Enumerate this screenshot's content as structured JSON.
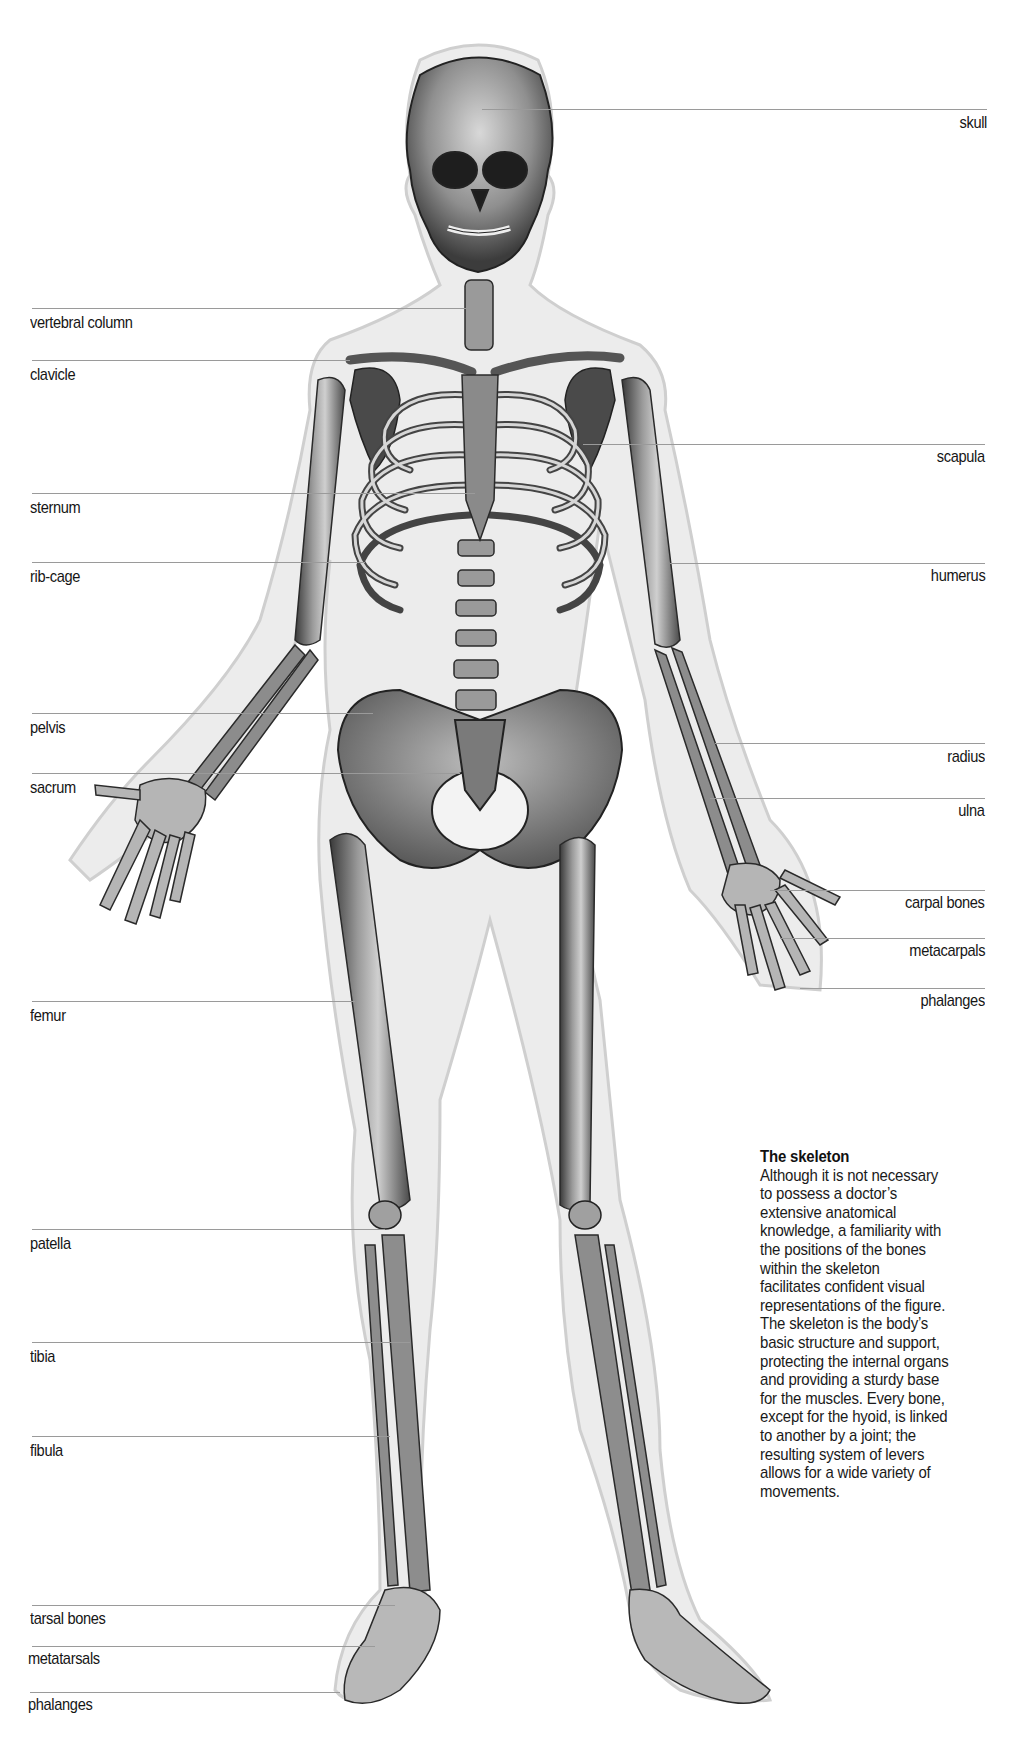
{
  "figure": {
    "title": "The skeleton",
    "caption_lines": [
      "Although it is not necessary",
      "to possess a doctor’s",
      "extensive anatomical",
      "knowledge, a familiarity with",
      "the positions of the bones",
      "within the skeleton",
      "facilitates confident visual",
      "representations of the figure.",
      "The skeleton is the body’s",
      "basic structure and support,",
      "protecting the internal organs",
      "and providing a sturdy base",
      "for the muscles. Every bone,",
      "except for the hyoid, is linked",
      "to another by a joint; the",
      "resulting system of levers",
      "allows for a wide variety of",
      "movements."
    ],
    "left_labels": [
      {
        "text": "vertebral column",
        "line_y": 308,
        "line_x1": 32,
        "line_x2": 470
      },
      {
        "text": "clavicle",
        "line_y": 360,
        "line_x1": 32,
        "line_x2": 350
      },
      {
        "text": "sternum",
        "line_y": 493,
        "line_x1": 32,
        "line_x2": 475
      },
      {
        "text": "rib-cage",
        "line_y": 562,
        "line_x1": 32,
        "line_x2": 365
      },
      {
        "text": "pelvis",
        "line_y": 713,
        "line_x1": 32,
        "line_x2": 373
      },
      {
        "text": "sacrum",
        "line_y": 773,
        "line_x1": 32,
        "line_x2": 460
      },
      {
        "text": "femur",
        "line_y": 1001,
        "line_x1": 32,
        "line_x2": 355
      },
      {
        "text": "patella",
        "line_y": 1229,
        "line_x1": 32,
        "line_x2": 385
      },
      {
        "text": "tibia",
        "line_y": 1342,
        "line_x1": 32,
        "line_x2": 410
      },
      {
        "text": "fibula",
        "line_y": 1436,
        "line_x1": 32,
        "line_x2": 390
      },
      {
        "text": "tarsal bones",
        "line_y": 1605,
        "line_x1": 32,
        "line_x2": 395
      },
      {
        "text": "metatarsals",
        "line_y": 1646,
        "line_x1": 32,
        "line_x2": 375
      },
      {
        "text": "phalanges",
        "line_y": 1692,
        "line_x1": 32,
        "line_x2": 340
      }
    ],
    "right_labels": [
      {
        "text": "skull",
        "line_y": 109,
        "line_x1": 482,
        "line_x2": 987
      },
      {
        "text": "scapula",
        "line_y": 444,
        "line_x1": 583,
        "line_x2": 985
      },
      {
        "text": "humerus",
        "line_y": 563,
        "line_x1": 670,
        "line_x2": 985
      },
      {
        "text": "radius",
        "line_y": 743,
        "line_x1": 715,
        "line_x2": 985
      },
      {
        "text": "ulna",
        "line_y": 798,
        "line_x1": 710,
        "line_x2": 985
      },
      {
        "text": "carpal bones",
        "line_y": 890,
        "line_x1": 770,
        "line_x2": 985
      },
      {
        "text": "metacarpals",
        "line_y": 938,
        "line_x1": 780,
        "line_x2": 985
      },
      {
        "text": "phalanges",
        "line_y": 988,
        "line_x1": 800,
        "line_x2": 985
      }
    ]
  }
}
